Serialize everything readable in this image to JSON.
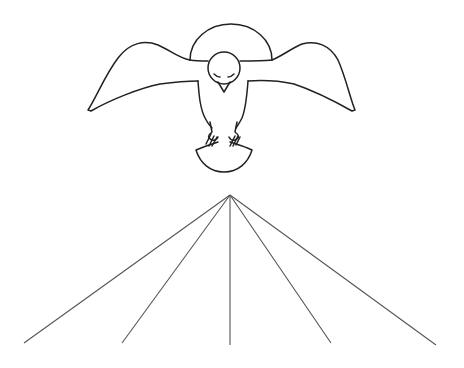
{
  "illustration": {
    "subject": "dove-with-halo-above-rays",
    "stroke_color": "#222222",
    "ray_color": "#555555",
    "background": "#ffffff",
    "bird": {
      "halo": {
        "cx": 231,
        "cy": 60,
        "rx": 41,
        "ry": 36
      },
      "head": {
        "cx": 224,
        "cy": 68,
        "r": 16
      }
    },
    "rays": {
      "apex": [
        230,
        195
      ],
      "endpoints": [
        [
          24,
          343
        ],
        [
          122,
          343
        ],
        [
          230,
          345
        ],
        [
          331,
          343
        ],
        [
          436,
          345
        ]
      ]
    }
  }
}
